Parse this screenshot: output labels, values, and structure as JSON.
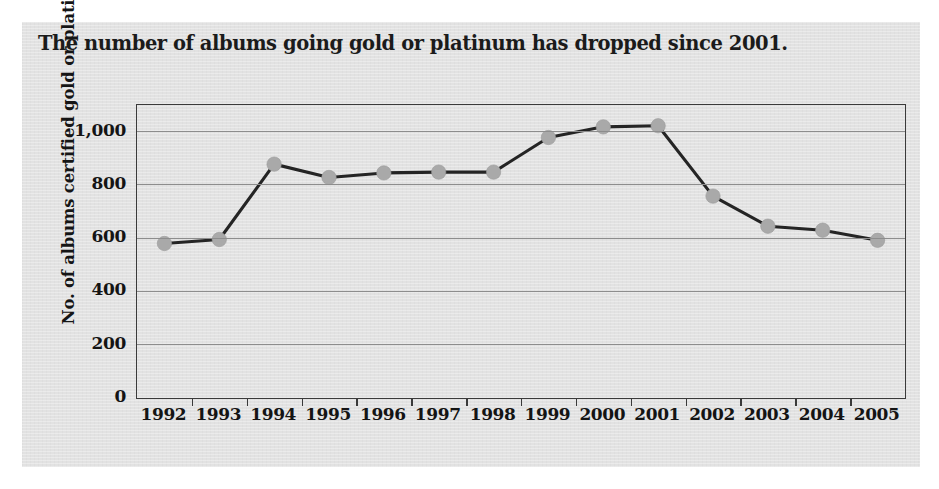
{
  "figure": {
    "title": "The number of albums going gold or platinum has dropped since 2001.",
    "panel_color": "#e2e2e2",
    "page_color": "#ffffff"
  },
  "chart_data": {
    "type": "line",
    "title": "The number of albums going gold or platinum has dropped since 2001.",
    "xlabel": "",
    "ylabel": "No. of albums certified gold or platinum",
    "categories": [
      "1992",
      "1993",
      "1994",
      "1995",
      "1996",
      "1997",
      "1998",
      "1999",
      "2000",
      "2001",
      "2002",
      "2003",
      "2004",
      "2005"
    ],
    "values": [
      580,
      595,
      878,
      828,
      845,
      848,
      848,
      978,
      1018,
      1022,
      758,
      645,
      630,
      592
    ],
    "series": [
      {
        "name": "No. of albums certified gold or platinum",
        "values": [
          580,
          595,
          878,
          828,
          845,
          848,
          848,
          978,
          1018,
          1022,
          758,
          645,
          630,
          592
        ],
        "line_color": "#242424",
        "marker_color": "#a9a9a9"
      }
    ],
    "ylim": [
      0,
      1100
    ],
    "yticks": [
      0,
      200,
      400,
      600,
      800,
      1000
    ],
    "ytick_labels": [
      "0",
      "200",
      "400",
      "600",
      "800",
      "1,000"
    ],
    "grid": true,
    "grid_axis": "y",
    "legend": false,
    "legend_position": "none",
    "marker_shape": "circle"
  }
}
